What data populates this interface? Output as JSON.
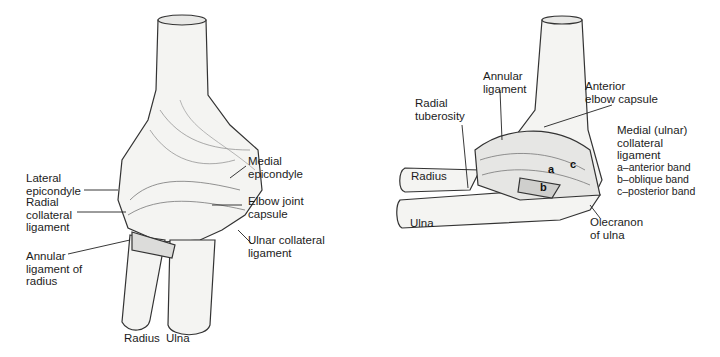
{
  "figures": [
    {
      "id": "posterior-view",
      "labels": {
        "lateral_epicondyle": "Lateral\nepicondyle",
        "radial_collateral": "Radial\ncollateral\nligament",
        "annular_radius": "Annular\nligament of\nradius",
        "medial_epicondyle": "Medial\nepicondyle",
        "elbow_capsule": "Elbow joint\ncapsule",
        "ulnar_collateral": "Ulnar collateral\nligament",
        "radius": "Radius",
        "ulna": "Ulna"
      }
    },
    {
      "id": "medial-view",
      "labels": {
        "annular": "Annular\nligament",
        "anterior_capsule": "Anterior\nelbow capsule",
        "radial_tuberosity": "Radial\ntuberosity",
        "radius": "Radius",
        "ulna": "Ulna",
        "medial_ulnar_collateral": "Medial (ulnar)\ncollateral\nligament",
        "band_a": "a–anterior band",
        "band_b": "b–oblique band",
        "band_c": "c–posterior band",
        "olecranon": "Olecranon\nof ulna"
      },
      "band_markers": [
        "a",
        "b",
        "c"
      ]
    }
  ]
}
